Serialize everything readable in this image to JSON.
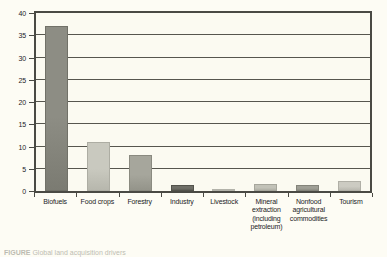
{
  "chart_data": {
    "type": "bar",
    "title": "",
    "xlabel": "",
    "ylabel": "",
    "ylim": [
      0,
      40
    ],
    "ytick_labels": [
      "0",
      "5",
      "10",
      "15",
      "20",
      "25",
      "30",
      "35",
      "40"
    ],
    "ytick_values": [
      0,
      5,
      10,
      15,
      20,
      25,
      30,
      35,
      40
    ],
    "grid": true,
    "legend": "none",
    "categories": [
      "Biofuels",
      "Food crops",
      "Forestry",
      "Industry",
      "Livestock",
      "Mineral extraction (including petroleum)",
      "Nonfood agricultural commodities",
      "Tourism"
    ],
    "category_lines": [
      [
        "Biofuels"
      ],
      [
        "Food crops"
      ],
      [
        "Forestry"
      ],
      [
        "Industry"
      ],
      [
        "Livestock"
      ],
      [
        "Mineral",
        "extraction",
        "(including",
        "petroleum)"
      ],
      [
        "Nonfood",
        "agricultural",
        "commodities"
      ],
      [
        "Tourism"
      ]
    ],
    "values": [
      37,
      11,
      8,
      1.3,
      0.4,
      1.6,
      1.4,
      2.2
    ],
    "bar_colors": [
      "#8d8d84",
      "#c9c9bf",
      "#a6a69c",
      "#6f6f68",
      "#cfcfc6",
      "#c2c2b8",
      "#9f9f96",
      "#cccbc2"
    ]
  },
  "axis": {
    "tick_color": "#4a4a44",
    "grid_color": "#56564e"
  },
  "caption": {
    "figure_label": "FIGURE",
    "text": "Global land acquisition drivers"
  },
  "colors": {
    "background": "#fdfcf4",
    "plot_background": "#fbfaf1",
    "frame": "#4a4a44",
    "text": "#23231f"
  }
}
